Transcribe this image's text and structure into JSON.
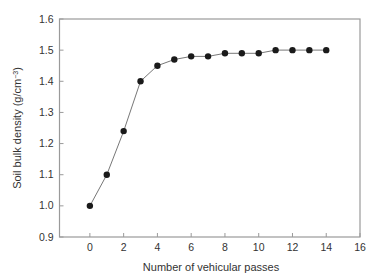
{
  "chart_data": {
    "type": "line",
    "title": "",
    "xlabel": "Number of vehicular passes",
    "ylabel": "Soil bulk density (g/cm⁻³)",
    "ylabel_text": "Soil bulk density (g/cm",
    "ylabel_sup": "−3",
    "ylabel_close": ")",
    "xlim": [
      -1.8,
      16
    ],
    "ylim": [
      0.9,
      1.6
    ],
    "xticks": [
      0,
      2,
      4,
      6,
      8,
      10,
      12,
      14,
      16
    ],
    "xtick_labels": [
      "0",
      "2",
      "4",
      "6",
      "8",
      "10",
      "12",
      "14",
      "16"
    ],
    "yticks": [
      0.9,
      1.0,
      1.1,
      1.2,
      1.3,
      1.4,
      1.5,
      1.6
    ],
    "ytick_labels": [
      "0.9",
      "1.0",
      "1.1",
      "1.2",
      "1.3",
      "1.4",
      "1.5",
      "1.6"
    ],
    "grid": false,
    "legend": null,
    "series": [
      {
        "name": "Soil bulk density",
        "x": [
          0,
          1,
          2,
          3,
          4,
          5,
          6,
          7,
          8,
          9,
          10,
          11,
          12,
          13,
          14
        ],
        "values": [
          1.0,
          1.1,
          1.24,
          1.4,
          1.45,
          1.47,
          1.48,
          1.48,
          1.49,
          1.49,
          1.49,
          1.5,
          1.5,
          1.5,
          1.5
        ],
        "marker": "filled-circle",
        "color": "#1a1a1a",
        "line_color": "#777777"
      }
    ]
  },
  "colors": {
    "axis": "#9a9a9a",
    "text": "#333333",
    "background": "#ffffff"
  }
}
